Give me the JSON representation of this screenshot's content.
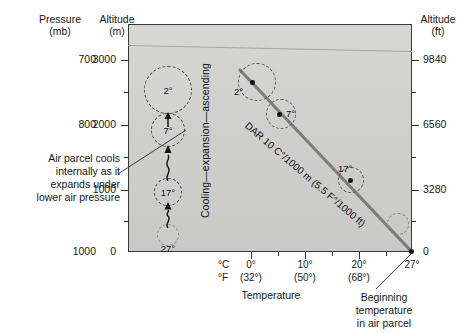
{
  "figure": {
    "title_hidden": "Dry Adiabatic Rate of an ascending air parcel"
  },
  "axes": {
    "pressure": {
      "header_line1": "Pressure",
      "header_line2": "(mb)",
      "ticks": [
        {
          "label": "700",
          "y": 60
        },
        {
          "label": "800",
          "y": 125
        },
        {
          "label": "1000",
          "y": 252
        }
      ]
    },
    "altitude_m": {
      "header_line1": "Altitude",
      "header_line2": "(m)",
      "ticks": [
        {
          "label": "3000",
          "y": 60
        },
        {
          "label": "2000",
          "y": 125
        },
        {
          "label": "1000",
          "y": 190
        },
        {
          "label": "0",
          "y": 252
        }
      ]
    },
    "altitude_ft": {
      "header_line1": "Altitude",
      "header_line2": "(ft)",
      "ticks": [
        {
          "label": "9840",
          "y": 60
        },
        {
          "label": "6560",
          "y": 125
        },
        {
          "label": "3280",
          "y": 190
        },
        {
          "label": "0",
          "y": 252
        }
      ]
    },
    "temperature": {
      "axis_title": "Temperature",
      "unit_c": "°C",
      "unit_f": "°F",
      "ticks_c": [
        {
          "label": "0°",
          "x": 251
        },
        {
          "label": "10°",
          "x": 305
        },
        {
          "label": "20°",
          "x": 359
        },
        {
          "label": "27°",
          "x": 412
        }
      ],
      "ticks_f": [
        {
          "label": "(32°)",
          "x": 251
        },
        {
          "label": "(50°)",
          "x": 305
        },
        {
          "label": "(68°)",
          "x": 359
        }
      ]
    }
  },
  "annotations": {
    "cooling": "Cooling—expansion—ascending",
    "dar_line": "DAR 10 C°/1000 m (5.5 F°/1000 ft)",
    "left_callout": {
      "line1": "Air parcel cools",
      "line2": "internally as it",
      "line3": "expands under",
      "line4": "lower air pressure"
    },
    "bottom_callout": {
      "line1": "Beginning",
      "line2": "temperature",
      "line3": "in air parcel"
    }
  },
  "parcels_column": [
    {
      "label": "2°",
      "cx": 168,
      "cy": 90,
      "r": 24
    },
    {
      "label": "7°",
      "cx": 168,
      "cy": 130,
      "r": 17
    },
    {
      "label": "17°",
      "cx": 168,
      "cy": 192,
      "r": 14
    },
    {
      "label": "27°",
      "cx": 168,
      "cy": 235,
      "r": 11
    }
  ],
  "parcels_on_line": [
    {
      "label": "2°",
      "dot_x": 252,
      "dot_y": 82,
      "r": 19,
      "lab_x": 236,
      "lab_y": 86
    },
    {
      "label": "7°",
      "dot_x": 279,
      "dot_y": 114,
      "r": 15,
      "lab_x": 288,
      "lab_y": 109
    },
    {
      "label": "17°",
      "dot_x": 350,
      "dot_y": 180,
      "r": 13,
      "lab_x": 340,
      "lab_y": 166
    },
    {
      "label": "",
      "dot_x": 398,
      "dot_y": 224,
      "r": 11,
      "lab_x": 0,
      "lab_y": 0
    }
  ],
  "dar_endpoints": {
    "x1": 240,
    "y1": 70,
    "x2": 412,
    "y2": 252
  },
  "colors": {
    "plot_background": "#d2d2d0",
    "frame": "#3a3a3a",
    "dar_line": "#7d7d7d",
    "text": "#171717",
    "parcel_outline": "#4a4a4a"
  }
}
